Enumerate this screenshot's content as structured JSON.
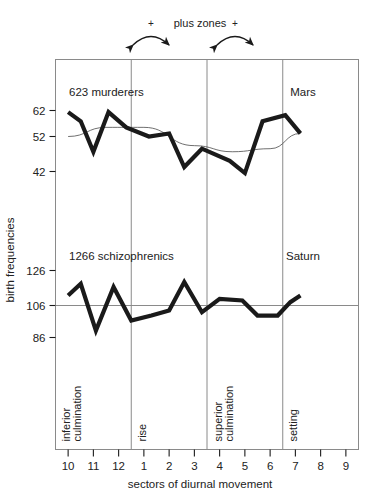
{
  "annotation": {
    "plus_zones_label": "plus zones",
    "plus_marks": [
      "+",
      "+"
    ]
  },
  "axis": {
    "y_title": "birth frequencies",
    "x_title": "sectors of diurnal movement",
    "x_ticks": [
      "10",
      "11",
      "12",
      "1",
      "2",
      "3",
      "4",
      "5",
      "6",
      "7",
      "8",
      "9"
    ],
    "sector_markers": [
      {
        "label": "inferior culmination",
        "sector_index": 0
      },
      {
        "label": "rise",
        "sector_index": 3
      },
      {
        "label": "superior culmination",
        "sector_index": 6
      },
      {
        "label": "setting",
        "sector_index": 9
      }
    ]
  },
  "chart_data": [
    {
      "type": "line",
      "title": "623 murderers",
      "series_name": "Mars",
      "panel": "upper",
      "xlabel": "sectors of diurnal movement",
      "ylabel": "birth frequencies",
      "categories": [
        "10",
        "11",
        "12",
        "1",
        "2",
        "3",
        "4",
        "5",
        "6",
        "7",
        "8",
        "9"
      ],
      "yticks": [
        62,
        52,
        42
      ],
      "ylim": [
        33,
        68
      ],
      "grid": false,
      "values": [
        60,
        53,
        48,
        60,
        56,
        54,
        53,
        55,
        42,
        48,
        44,
        40,
        57,
        59,
        53
      ],
      "data_points": [
        {
          "x": 0.0,
          "y": 60
        },
        {
          "x": 0.5,
          "y": 57
        },
        {
          "x": 1.0,
          "y": 47
        },
        {
          "x": 1.6,
          "y": 60
        },
        {
          "x": 2.3,
          "y": 55
        },
        {
          "x": 3.2,
          "y": 52
        },
        {
          "x": 4.0,
          "y": 53
        },
        {
          "x": 4.6,
          "y": 42
        },
        {
          "x": 5.3,
          "y": 48
        },
        {
          "x": 6.4,
          "y": 44
        },
        {
          "x": 7.0,
          "y": 40
        },
        {
          "x": 7.7,
          "y": 57
        },
        {
          "x": 8.6,
          "y": 59
        },
        {
          "x": 9.2,
          "y": 53
        }
      ],
      "smooth_curve": {
        "name": "theoretical-curve",
        "description": "thin smooth sinusoidal trend line",
        "points": [
          {
            "x": 0.0,
            "y": 52
          },
          {
            "x": 1.5,
            "y": 55
          },
          {
            "x": 3.0,
            "y": 55
          },
          {
            "x": 5.0,
            "y": 49
          },
          {
            "x": 6.5,
            "y": 47
          },
          {
            "x": 8.0,
            "y": 48
          },
          {
            "x": 9.2,
            "y": 53
          }
        ]
      }
    },
    {
      "type": "line",
      "title": "1266 schizophrenics",
      "series_name": "Saturn",
      "panel": "lower",
      "xlabel": "sectors of diurnal movement",
      "ylabel": "birth frequencies",
      "categories": [
        "10",
        "11",
        "12",
        "1",
        "2",
        "3",
        "4",
        "5",
        "6",
        "7",
        "8",
        "9"
      ],
      "yticks": [
        126,
        106,
        86
      ],
      "ylim": [
        77,
        132
      ],
      "grid": false,
      "reference_line": 106,
      "values": [
        112,
        119,
        92,
        117,
        100,
        97,
        103,
        118,
        101,
        110,
        109,
        101,
        100,
        108,
        117
      ],
      "data_points": [
        {
          "x": 0.0,
          "y": 112
        },
        {
          "x": 0.5,
          "y": 119
        },
        {
          "x": 1.1,
          "y": 91
        },
        {
          "x": 1.8,
          "y": 117
        },
        {
          "x": 2.5,
          "y": 97
        },
        {
          "x": 3.3,
          "y": 100
        },
        {
          "x": 4.0,
          "y": 103
        },
        {
          "x": 4.6,
          "y": 120
        },
        {
          "x": 5.3,
          "y": 102
        },
        {
          "x": 6.0,
          "y": 110
        },
        {
          "x": 6.9,
          "y": 109
        },
        {
          "x": 7.5,
          "y": 100
        },
        {
          "x": 8.3,
          "y": 100
        },
        {
          "x": 8.8,
          "y": 108
        },
        {
          "x": 9.2,
          "y": 112
        }
      ]
    }
  ],
  "colors": {
    "ink": "#1a1a1a",
    "frame": "#8a8a8a",
    "thin_curve": "#4a4a4a",
    "background": "#ffffff"
  }
}
